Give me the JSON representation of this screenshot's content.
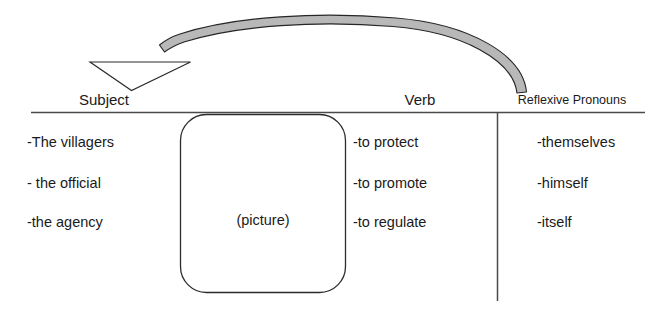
{
  "diagram": {
    "background_color": "#ffffff",
    "line_color": "#3a3a3a",
    "text_color": "#1a1a1a",
    "arc_fill_color": "#b3b3b3",
    "arc_stroke_color": "#2b2b2b"
  },
  "columns": {
    "subject": {
      "header": "Subject",
      "items": [
        "-The villagers",
        "- the official",
        "-the agency"
      ]
    },
    "verb": {
      "header": "Verb",
      "items": [
        "-to protect",
        "-to promote",
        "-to regulate"
      ]
    },
    "pronouns": {
      "header": "Reflexive Pronouns",
      "items": [
        "-themselves",
        "-himself",
        "-itself"
      ]
    }
  },
  "picture_box": {
    "label": "(picture)"
  },
  "arrow": {
    "name": "reference-arrow",
    "direction": "from Reflexive Pronouns to Subject",
    "head_shape": "hollow-triangle"
  }
}
